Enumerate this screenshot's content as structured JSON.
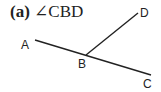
{
  "title": {
    "label": "(a)",
    "angle_symbol": "∠",
    "angle_name": "CBD"
  },
  "diagram": {
    "line_color": "#222222",
    "points": {
      "A": {
        "label": "A",
        "x": 35,
        "y": 40
      },
      "B": {
        "label": "B",
        "x": 86,
        "y": 55
      },
      "C": {
        "label": "C",
        "x": 151,
        "y": 75
      },
      "D": {
        "label": "D",
        "x": 138,
        "y": 13
      }
    },
    "segments": [
      {
        "from": "A",
        "to": "C"
      },
      {
        "from": "B",
        "to": "D"
      }
    ]
  }
}
